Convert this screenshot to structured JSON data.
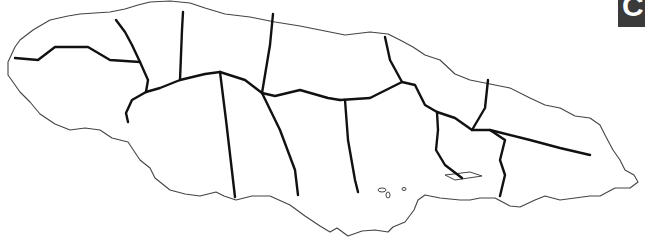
{
  "map": {
    "subject": "Jamaica parish outline map",
    "labels": [],
    "stroke_colors": {
      "coastline": "#444444",
      "parish_border": "#111111"
    },
    "background": "#ffffff"
  },
  "corner_tab": {
    "glyph": "C",
    "background": "#3a3a3a"
  }
}
